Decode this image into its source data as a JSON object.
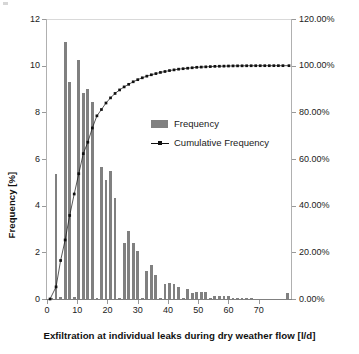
{
  "chart_data": {
    "type": "bar",
    "title": "",
    "xlabel": "Exfiltration at individual leaks during dry weather flow [l/d]",
    "ylabel": "Frequency [%]",
    "ylabel_secondary": "",
    "grid": false,
    "legend_position": "inside-upper-center",
    "xlim": [
      0,
      81
    ],
    "ylim": [
      0,
      12
    ],
    "ylim_secondary": [
      0,
      1.2
    ],
    "xticks": [
      0,
      10,
      20,
      30,
      40,
      50,
      60,
      70
    ],
    "xtick_labels": [
      "0",
      "10",
      "20",
      "30",
      "40",
      "50",
      "60",
      "70"
    ],
    "yticks": [
      0,
      2,
      4,
      6,
      8,
      10,
      12
    ],
    "ytick_labels": [
      "0",
      "2",
      "4",
      "6",
      "8",
      "10",
      "12"
    ],
    "yticks_secondary": [
      0,
      0.2,
      0.4,
      0.6,
      0.8,
      1.0,
      1.2
    ],
    "ytick_labels_secondary": [
      "0.00%",
      "20.00%",
      "40.00%",
      "60.00%",
      "80.00%",
      "100.00%",
      "120.00%"
    ],
    "bar_color": "#808080",
    "line_color": "#111111",
    "series": [
      {
        "name": "Frequency",
        "type": "bar",
        "axis": "left",
        "x": [
          1.5,
          3,
          4.5,
          6,
          7.5,
          9,
          10.5,
          12,
          13.5,
          15,
          16.5,
          18,
          19.5,
          21,
          22.5,
          24,
          25.5,
          27,
          28.5,
          30,
          31.5,
          33,
          34.5,
          36,
          37.5,
          39,
          40.5,
          42,
          43.5,
          45,
          46.5,
          48,
          49.5,
          51,
          52.5,
          54,
          55.5,
          57,
          58.5,
          60,
          61.5,
          63,
          64.5,
          66,
          67.5,
          69,
          70.5,
          72,
          73.5,
          75,
          76.5,
          78,
          79.5
        ],
        "values": [
          0.05,
          5.35,
          0.1,
          11.0,
          9.3,
          0.1,
          10.25,
          8.85,
          9.0,
          8.45,
          0.05,
          5.65,
          5.1,
          5.5,
          4.35,
          0.05,
          2.4,
          2.9,
          2.4,
          2.05,
          0.05,
          1.2,
          1.45,
          1.05,
          0.05,
          0.65,
          0.7,
          0.65,
          0.5,
          0.05,
          0.45,
          0.25,
          0.3,
          0.3,
          0.3,
          0.05,
          0.12,
          0.12,
          0.12,
          0.12,
          0.05,
          0.03,
          0.03,
          0.02,
          0.02,
          0.0,
          0.0,
          0.0,
          0.0,
          0.0,
          0.0,
          0.0,
          0.25
        ]
      },
      {
        "name": "Cumulative Frequency",
        "type": "line",
        "axis": "right",
        "marker": "square",
        "x": [
          1.0,
          3.0,
          4.5,
          6.0,
          7.5,
          9.0,
          10.5,
          12.0,
          13.5,
          15.0,
          16.5,
          18.0,
          19.5,
          21.0,
          22.5,
          24.0,
          25.5,
          27.0,
          28.5,
          30.0,
          31.5,
          33.0,
          34.5,
          36.0,
          37.5,
          39.0,
          40.5,
          42.0,
          43.5,
          45.0,
          46.5,
          48.0,
          49.5,
          51.0,
          52.5,
          54.0,
          55.5,
          57.0,
          58.5,
          60.0,
          61.5,
          63.0,
          64.5,
          66.0,
          67.5,
          69.0,
          70.5,
          72.0,
          73.5,
          75.0,
          76.5,
          78.0,
          80.0
        ],
        "values": [
          0.0,
          0.052,
          0.165,
          0.253,
          0.358,
          0.45,
          0.537,
          0.623,
          0.672,
          0.733,
          0.785,
          0.812,
          0.84,
          0.862,
          0.881,
          0.896,
          0.909,
          0.92,
          0.931,
          0.94,
          0.948,
          0.955,
          0.961,
          0.966,
          0.971,
          0.975,
          0.979,
          0.982,
          0.985,
          0.987,
          0.989,
          0.991,
          0.993,
          0.994,
          0.995,
          0.996,
          0.997,
          0.9975,
          0.998,
          0.9985,
          0.999,
          0.9992,
          0.9994,
          0.9996,
          0.9997,
          0.9998,
          0.9998,
          0.9999,
          0.9999,
          1.0,
          1.0,
          1.0,
          1.0
        ]
      }
    ],
    "legend_entries": [
      "Frequency",
      "Cumulative Frequency"
    ]
  },
  "legend": {
    "frequency_label": "Frequency",
    "cumulative_label": "Cumulative Frequency"
  }
}
